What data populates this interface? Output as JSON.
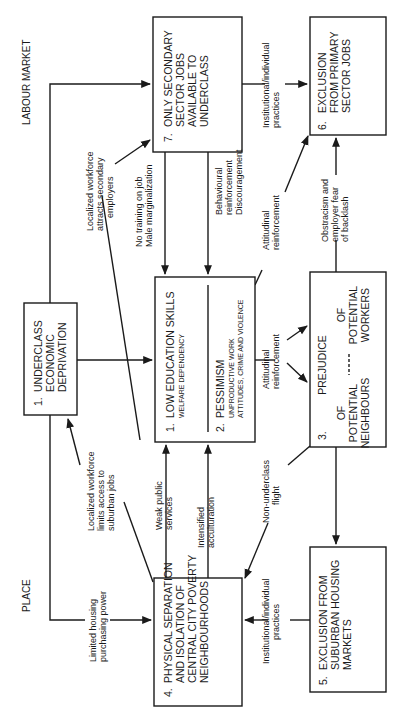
{
  "sections": {
    "labour_market": "LABOUR MARKET",
    "place": "PLACE"
  },
  "boxes": {
    "b1": {
      "num": "1.",
      "lines": [
        "UNDERCLASS",
        "ECONOMIC",
        "DEPRIVATION"
      ]
    },
    "b2": {
      "part1": {
        "num": "1.",
        "title": "LOW EDUCATION SKILLS",
        "sub": "WELFARE DEPENDENCY"
      },
      "part2": {
        "num": "2.",
        "title": "PESSIMISM",
        "sub1": "UNPRODUCTIVE WORK",
        "sub2": "ATTITUDES, CRIME AND VIOLENCE"
      }
    },
    "b3": {
      "num": "3.",
      "title": "PREJUDICE",
      "left": [
        "OF",
        "POTENTIAL",
        "NEIGHBOURS"
      ],
      "right": [
        "OF",
        "POTENTIAL",
        "WORKERS"
      ]
    },
    "b4": {
      "num": "4.",
      "lines": [
        "PHYSICAL SEPARATION",
        "AND ISOLATION OF",
        "CENTRAL CITY POVERTY",
        "NEIGHBOURHOODS"
      ]
    },
    "b5": {
      "num": "5.",
      "lines": [
        "EXCLUSION FROM",
        "SUBURBAN HOUSING",
        "MARKETS"
      ]
    },
    "b6": {
      "num": "6.",
      "lines": [
        "EXCLUSION",
        "FROM PRIMARY",
        "SECTOR JOBS"
      ]
    },
    "b7": {
      "num": "7.",
      "lines": [
        "ONLY SECONDARY",
        "SECTOR JOBS",
        "AVAILABLE TO",
        "UNDERCLASS"
      ]
    }
  },
  "labels": {
    "localized_attracts": [
      "Localized workforce",
      "attracts secondary",
      "employers"
    ],
    "no_training": [
      "No training on job",
      "Male marginalization"
    ],
    "behavioural": [
      "Behavioural",
      "reinforcement",
      "Discouragement"
    ],
    "attitudinal_top": [
      "Attitudinal",
      "reinforcement"
    ],
    "institutional_top": [
      "Institutional/individual",
      "practices"
    ],
    "obstracism": [
      "Obstracism and",
      "employer fear",
      "of backlash"
    ],
    "attitudinal_mid": [
      "Attitudinal",
      "reinforcement"
    ],
    "localized_limits": [
      "Localized workforce",
      "limits access to",
      "suburban jobs"
    ],
    "weak_public": [
      "Weak public",
      "services"
    ],
    "intensified": [
      "Intensified",
      "acculturation"
    ],
    "non_underclass": [
      "Non-underclass",
      "flight"
    ],
    "limited_housing": [
      "Limited housing",
      "purchasing power"
    ],
    "institutional_bottom": [
      "Institutional/individual",
      "practices"
    ]
  }
}
